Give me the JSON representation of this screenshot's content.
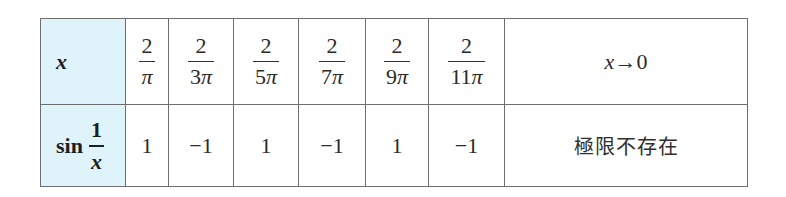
{
  "table": {
    "row_headers": {
      "x": {
        "variable": "x"
      },
      "sin": {
        "func": "sin",
        "numerator": "1",
        "denominator": "x"
      }
    },
    "x_values": [
      {
        "numerator": "2",
        "coef": "",
        "pi": "π"
      },
      {
        "numerator": "2",
        "coef": "3",
        "pi": "π"
      },
      {
        "numerator": "2",
        "coef": "5",
        "pi": "π"
      },
      {
        "numerator": "2",
        "coef": "7",
        "pi": "π"
      },
      {
        "numerator": "2",
        "coef": "9",
        "pi": "π"
      },
      {
        "numerator": "2",
        "coef": "11",
        "pi": "π"
      }
    ],
    "sin_values": [
      "1",
      "−1",
      "1",
      "−1",
      "1",
      "−1"
    ],
    "limit": {
      "variable": "x",
      "arrow": "→",
      "target": "0",
      "result": "極限不存在"
    }
  },
  "colors": {
    "header_background": "#dff3fa",
    "border": "#6e6e6e"
  }
}
